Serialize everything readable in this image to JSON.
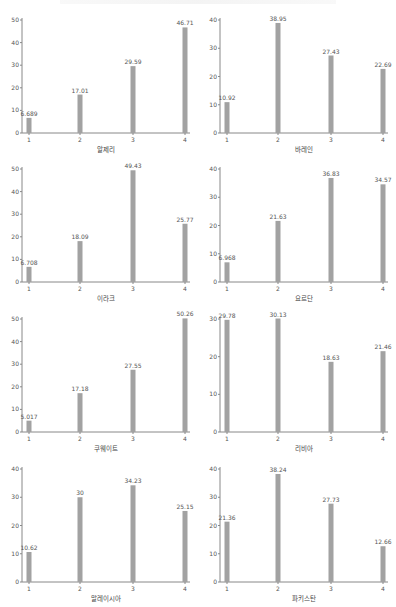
{
  "chart_data": [
    {
      "type": "bar",
      "title": "",
      "xlabel": "알제리",
      "ylabel": "",
      "categories": [
        "1",
        "2",
        "3",
        "4"
      ],
      "values": [
        6.689,
        17.01,
        29.59,
        46.71
      ],
      "value_labels": [
        "6.689",
        "17.01",
        "29.59",
        "46.71"
      ],
      "yticks": [
        0,
        10,
        20,
        30,
        40,
        50
      ],
      "ylim": [
        0,
        50
      ],
      "grid": false
    },
    {
      "type": "bar",
      "title": "",
      "xlabel": "바레인",
      "ylabel": "",
      "categories": [
        "1",
        "2",
        "3",
        "4"
      ],
      "values": [
        10.92,
        38.95,
        27.43,
        22.69
      ],
      "value_labels": [
        "10.92",
        "38.95",
        "27.43",
        "22.69"
      ],
      "yticks": [
        0,
        10,
        20,
        30,
        40
      ],
      "ylim": [
        0,
        40
      ],
      "grid": false
    },
    {
      "type": "bar",
      "title": "",
      "xlabel": "이라크",
      "ylabel": "",
      "categories": [
        "1",
        "2",
        "3",
        "4"
      ],
      "values": [
        6.708,
        18.09,
        49.43,
        25.77
      ],
      "value_labels": [
        "6.708",
        "18.09",
        "49.43",
        "25.77"
      ],
      "yticks": [
        0,
        10,
        20,
        30,
        40,
        50
      ],
      "ylim": [
        0,
        50
      ],
      "grid": false
    },
    {
      "type": "bar",
      "title": "",
      "xlabel": "요르단",
      "ylabel": "",
      "categories": [
        "1",
        "2",
        "3",
        "4"
      ],
      "values": [
        6.968,
        21.63,
        36.83,
        34.57
      ],
      "value_labels": [
        "6.968",
        "21.63",
        "36.83",
        "34.57"
      ],
      "yticks": [
        0,
        10,
        20,
        30,
        40
      ],
      "ylim": [
        0,
        40
      ],
      "grid": false
    },
    {
      "type": "bar",
      "title": "",
      "xlabel": "쿠웨이트",
      "ylabel": "",
      "categories": [
        "1",
        "2",
        "3",
        "4"
      ],
      "values": [
        5.017,
        17.18,
        27.55,
        50.26
      ],
      "value_labels": [
        "5.017",
        "17.18",
        "27.55",
        "50.26"
      ],
      "yticks": [
        0,
        10,
        20,
        30,
        40,
        50
      ],
      "ylim": [
        0,
        50
      ],
      "grid": false
    },
    {
      "type": "bar",
      "title": "",
      "xlabel": "리비아",
      "ylabel": "",
      "categories": [
        "1",
        "2",
        "3",
        "4"
      ],
      "values": [
        29.78,
        30.13,
        18.63,
        21.46
      ],
      "value_labels": [
        "29.78",
        "30.13",
        "18.63",
        "21.46"
      ],
      "yticks": [
        0,
        10,
        20,
        30
      ],
      "ylim": [
        0,
        30
      ],
      "grid": false
    },
    {
      "type": "bar",
      "title": "",
      "xlabel": "말레이시아",
      "ylabel": "",
      "categories": [
        "1",
        "2",
        "3",
        "4"
      ],
      "values": [
        10.62,
        30,
        34.23,
        25.15
      ],
      "value_labels": [
        "10.62",
        "30",
        "34.23",
        "25.15"
      ],
      "yticks": [
        0,
        10,
        20,
        30,
        40
      ],
      "ylim": [
        0,
        40
      ],
      "grid": false
    },
    {
      "type": "bar",
      "title": "",
      "xlabel": "파키스탄",
      "ylabel": "",
      "categories": [
        "1",
        "2",
        "3",
        "4"
      ],
      "values": [
        21.36,
        38.24,
        27.73,
        12.66
      ],
      "value_labels": [
        "21.36",
        "38.24",
        "27.73",
        "12.66"
      ],
      "yticks": [
        0,
        10,
        20,
        30,
        40
      ],
      "ylim": [
        0,
        40
      ],
      "grid": false
    }
  ],
  "colors": {
    "bar": "#a2a2a2",
    "axis": "#888888",
    "text": "#555555"
  }
}
